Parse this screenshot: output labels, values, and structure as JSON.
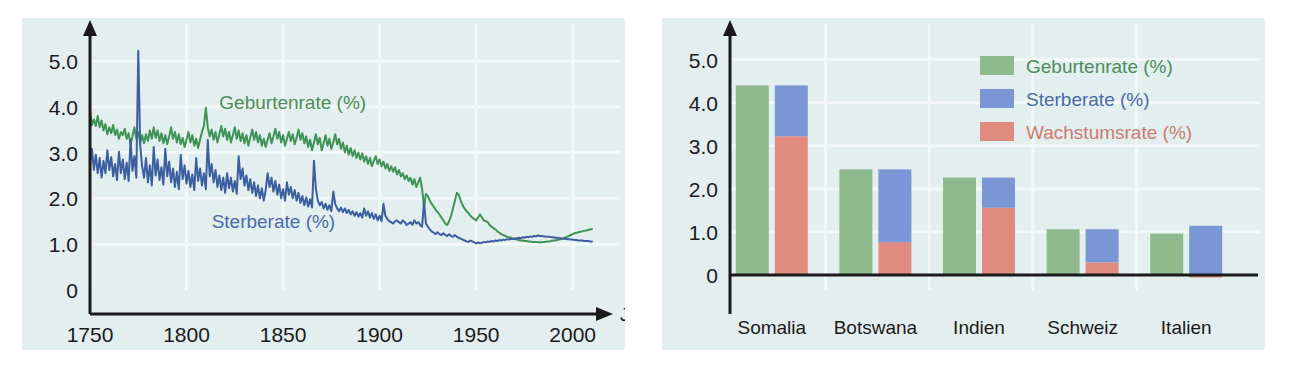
{
  "figure": {
    "background": "#ffffff",
    "panel_background": "#e3eeee",
    "colors": {
      "green": "#8fba8d",
      "blue": "#7b96d4",
      "red": "#e08a80",
      "green_line": "#3e9456",
      "blue_line": "#3c5fa0",
      "axis": "#1a1a1a",
      "grid": "#f2f8f8"
    }
  },
  "chart_data": [
    {
      "id": "left",
      "type": "line",
      "title": "",
      "xlabel": "Jahr",
      "ylabel": "",
      "xlim": [
        1750,
        2010
      ],
      "ylim": [
        0,
        5.5
      ],
      "xticks": [
        "1750",
        "1800",
        "1850",
        "1900",
        "1950",
        "2000"
      ],
      "xtick_values": [
        1750,
        1800,
        1850,
        1900,
        1950,
        2000
      ],
      "yticks": [
        "0",
        "1.0",
        "2.0",
        "3.0",
        "4.0",
        "5.0"
      ],
      "ytick_values": [
        0,
        1,
        2,
        3,
        4,
        5
      ],
      "grid": true,
      "legend_position": "inline-annotations",
      "annotations": [
        {
          "text": "Geburtenrate (%)",
          "color": "#4e8c5c",
          "x": 1855,
          "y": 3.95
        },
        {
          "text": "Sterberate (%)",
          "color": "#4a6ba8",
          "x": 1845,
          "y": 1.35
        }
      ],
      "series": [
        {
          "name": "Geburtenrate (%)",
          "color": "#3e9456",
          "x_start": 1750,
          "x_step": 1,
          "values": [
            3.92,
            3.6,
            3.72,
            3.58,
            3.8,
            3.55,
            3.7,
            3.48,
            3.62,
            3.4,
            3.55,
            3.42,
            3.6,
            3.38,
            3.5,
            3.3,
            3.45,
            3.38,
            3.52,
            3.3,
            3.42,
            3.18,
            3.35,
            3.55,
            3.3,
            3.45,
            3.22,
            3.38,
            3.2,
            3.4,
            3.25,
            3.48,
            3.3,
            3.55,
            3.32,
            3.48,
            3.25,
            3.42,
            3.2,
            3.38,
            3.18,
            3.35,
            3.55,
            3.3,
            3.45,
            3.22,
            3.4,
            3.18,
            3.32,
            3.12,
            3.28,
            3.45,
            3.22,
            3.38,
            3.15,
            3.3,
            3.1,
            3.28,
            3.45,
            3.58,
            3.98,
            3.55,
            3.35,
            3.5,
            3.28,
            3.45,
            3.22,
            3.4,
            3.58,
            3.35,
            3.52,
            3.28,
            3.45,
            3.22,
            3.38,
            3.55,
            3.3,
            3.48,
            3.25,
            3.42,
            3.2,
            3.38,
            3.15,
            3.32,
            3.5,
            3.28,
            3.45,
            3.22,
            3.38,
            3.15,
            3.3,
            3.12,
            3.28,
            3.42,
            3.2,
            3.35,
            3.52,
            3.3,
            3.45,
            3.22,
            3.38,
            3.15,
            3.3,
            3.45,
            3.25,
            3.4,
            3.18,
            3.32,
            3.5,
            3.28,
            3.42,
            3.2,
            3.35,
            3.12,
            3.28,
            3.05,
            3.22,
            3.4,
            3.18,
            3.32,
            3.05,
            3.2,
            3.38,
            3.15,
            3.3,
            3.08,
            3.22,
            3.4,
            3.18,
            3.3,
            3.08,
            3.22,
            3.0,
            3.15,
            2.95,
            3.1,
            2.92,
            3.05,
            2.88,
            3.0,
            2.85,
            2.98,
            2.8,
            2.92,
            2.75,
            2.88,
            2.7,
            2.82,
            2.92,
            2.75,
            2.85,
            2.7,
            2.8,
            2.65,
            2.75,
            2.6,
            2.7,
            2.58,
            2.68,
            2.52,
            2.62,
            2.48,
            2.55,
            2.42,
            2.5,
            2.38,
            2.45,
            2.3,
            2.42,
            2.25,
            2.35,
            2.45,
            2.2,
            1.82,
            2.1,
            2.05,
            1.95,
            1.88,
            1.82,
            1.75,
            1.7,
            1.65,
            1.58,
            1.52,
            1.45,
            1.42,
            1.5,
            1.62,
            1.78,
            1.95,
            2.12,
            2.08,
            1.95,
            1.85,
            1.78,
            1.72,
            1.68,
            1.62,
            1.58,
            1.55,
            1.52,
            1.58,
            1.65,
            1.58,
            1.52,
            1.5,
            1.48,
            1.42,
            1.38,
            1.35,
            1.32,
            1.28,
            1.25,
            1.22,
            1.2,
            1.18,
            1.16,
            1.15,
            1.14,
            1.12,
            1.11,
            1.1,
            1.09,
            1.08,
            1.08,
            1.07,
            1.07,
            1.06,
            1.06,
            1.05,
            1.05,
            1.05,
            1.04,
            1.04,
            1.04,
            1.05,
            1.05,
            1.06,
            1.06,
            1.07,
            1.08,
            1.08,
            1.09,
            1.1,
            1.11,
            1.12,
            1.14,
            1.16,
            1.18,
            1.2,
            1.22,
            1.24,
            1.25,
            1.26,
            1.27,
            1.28,
            1.29,
            1.3,
            1.31,
            1.32,
            1.33
          ]
        },
        {
          "name": "Sterberate (%)",
          "color": "#3c5fa0",
          "x_start": 1750,
          "x_step": 1,
          "values": [
            2.72,
            3.08,
            2.62,
            2.95,
            2.55,
            2.88,
            2.45,
            2.82,
            2.55,
            3.05,
            2.62,
            2.9,
            2.48,
            2.75,
            2.4,
            3.02,
            2.55,
            2.85,
            2.42,
            2.78,
            2.38,
            3.28,
            2.6,
            2.92,
            2.45,
            5.22,
            3.15,
            2.7,
            2.45,
            2.88,
            2.35,
            2.72,
            2.28,
            3.12,
            2.5,
            2.85,
            2.4,
            2.68,
            2.3,
            3.08,
            2.48,
            2.8,
            2.35,
            2.65,
            2.25,
            2.58,
            2.2,
            2.95,
            2.42,
            2.72,
            2.32,
            2.6,
            2.25,
            2.52,
            2.18,
            2.88,
            2.38,
            2.65,
            2.28,
            2.55,
            2.2,
            3.28,
            2.48,
            2.75,
            2.35,
            2.62,
            2.25,
            2.5,
            2.18,
            2.45,
            2.12,
            2.55,
            2.22,
            2.45,
            2.15,
            2.38,
            2.1,
            2.92,
            2.42,
            2.65,
            2.28,
            2.5,
            2.18,
            2.42,
            2.12,
            2.35,
            2.05,
            2.28,
            2.0,
            2.22,
            1.95,
            2.18,
            2.55,
            2.25,
            2.45,
            2.15,
            2.38,
            2.08,
            2.3,
            2.0,
            2.2,
            1.95,
            2.35,
            2.08,
            2.25,
            2.0,
            2.18,
            1.95,
            2.12,
            1.9,
            2.05,
            1.85,
            2.02,
            1.82,
            1.98,
            1.8,
            2.82,
            2.2,
            1.95,
            1.85,
            1.92,
            1.78,
            1.88,
            1.75,
            1.85,
            1.72,
            2.15,
            1.88,
            1.78,
            1.72,
            1.8,
            1.7,
            1.78,
            1.68,
            1.75,
            1.65,
            1.72,
            1.62,
            1.7,
            1.6,
            1.68,
            1.58,
            1.78,
            1.62,
            1.72,
            1.58,
            1.68,
            1.55,
            1.65,
            1.52,
            1.62,
            1.5,
            1.88,
            1.62,
            1.55,
            1.5,
            1.48,
            1.45,
            1.5,
            1.52,
            1.48,
            1.45,
            1.52,
            1.48,
            1.42,
            1.45,
            1.48,
            1.42,
            1.52,
            1.45,
            1.48,
            1.42,
            1.38,
            1.92,
            1.45,
            1.38,
            1.32,
            1.28,
            1.25,
            1.22,
            1.26,
            1.22,
            1.2,
            1.24,
            1.2,
            1.18,
            1.22,
            1.18,
            1.16,
            1.2,
            1.16,
            1.14,
            1.12,
            1.1,
            1.08,
            1.06,
            1.05,
            1.08,
            1.06,
            1.04,
            1.02,
            1.04,
            1.02,
            1.03,
            1.05,
            1.04,
            1.06,
            1.05,
            1.07,
            1.06,
            1.08,
            1.07,
            1.09,
            1.08,
            1.1,
            1.09,
            1.11,
            1.1,
            1.12,
            1.11,
            1.13,
            1.12,
            1.14,
            1.13,
            1.15,
            1.14,
            1.16,
            1.15,
            1.17,
            1.16,
            1.18,
            1.17,
            1.19,
            1.18,
            1.18,
            1.17,
            1.17,
            1.16,
            1.16,
            1.15,
            1.15,
            1.14,
            1.14,
            1.13,
            1.13,
            1.12,
            1.12,
            1.11,
            1.11,
            1.1,
            1.1,
            1.09,
            1.09,
            1.08,
            1.08,
            1.08,
            1.07,
            1.07,
            1.07,
            1.06,
            1.06
          ]
        }
      ]
    },
    {
      "id": "right",
      "type": "bar",
      "title": "",
      "xlabel": "",
      "ylabel": "",
      "ylim": [
        -0.35,
        5.5
      ],
      "yticks": [
        "0",
        "1.0",
        "2.0",
        "3.0",
        "4.0",
        "5.0"
      ],
      "ytick_values": [
        0,
        1,
        2,
        3,
        4,
        5
      ],
      "grid": true,
      "legend_position": "top-right",
      "categories": [
        "Somalia",
        "Botswana",
        "Indien",
        "Schweiz",
        "Italien"
      ],
      "series": [
        {
          "name": "Geburtenrate (%)",
          "color": "#8fba8d",
          "values": [
            4.4,
            2.45,
            2.26,
            1.06,
            0.96
          ]
        },
        {
          "name": "Wachstumsrate (%)",
          "color": "#e08a80",
          "values": [
            3.22,
            0.76,
            1.56,
            0.29,
            -0.06
          ]
        },
        {
          "name": "Sterberate (%)",
          "color": "#7b96d4",
          "values": [
            1.18,
            1.69,
            0.7,
            0.77,
            1.14
          ]
        }
      ],
      "stacked_note": "Right bar of each pair is Wachstumsrate stacked with Sterberate; total equals Geburtenrate",
      "legend_items": [
        {
          "label": "Geburtenrate (%)",
          "color": "#8fba8d",
          "text_color": "#4e8c5c"
        },
        {
          "label": "Sterberate (%)",
          "color": "#7b96d4",
          "text_color": "#4a6ba8"
        },
        {
          "label": "Wachstumsrate (%)",
          "color": "#e08a80",
          "text_color": "#cc7b72"
        }
      ]
    }
  ]
}
